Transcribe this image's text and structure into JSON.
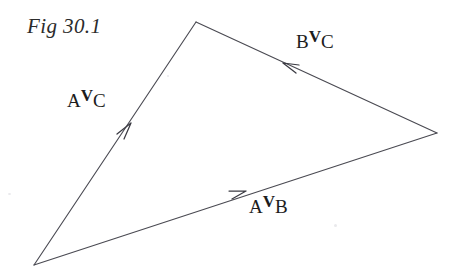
{
  "figure": {
    "caption": "Fig 30.1",
    "type": "velocity-triangle-vector-diagram",
    "background_color": "#ffffff",
    "stroke_color": "#4a4a52",
    "text_color": "#1c1c1c"
  },
  "labels": {
    "a_v_c": {
      "pre": "A",
      "symbol": "V",
      "post": "C",
      "full": "AVC"
    },
    "b_v_c": {
      "pre": "B",
      "symbol": "V",
      "post": "C",
      "full": "BVC"
    },
    "a_v_b": {
      "pre": "A",
      "symbol": "V",
      "post": "B",
      "full": "AVB"
    }
  },
  "geometry": {
    "vertices": {
      "apex": [
        196,
        22
      ],
      "right": [
        437,
        133
      ],
      "bottom_left": [
        34,
        265
      ]
    },
    "arrows": [
      {
        "name": "a-v-c-arrow",
        "from": [
          34,
          265
        ],
        "to": [
          196,
          22
        ],
        "arrowhead_at": [
          131,
          123
        ],
        "direction": "up-right"
      },
      {
        "name": "b-v-c-arrow",
        "from": [
          437,
          133
        ],
        "to": [
          196,
          22
        ],
        "arrowhead_at": [
          283,
          63
        ],
        "direction": "up-left"
      },
      {
        "name": "a-v-b-arrow",
        "from": [
          34,
          265
        ],
        "to": [
          437,
          133
        ],
        "arrowhead_at": [
          246,
          191
        ],
        "direction": "right-up"
      }
    ]
  }
}
